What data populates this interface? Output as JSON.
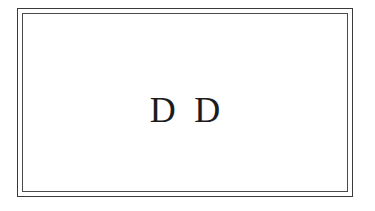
{
  "canvas": {
    "width": 375,
    "height": 211,
    "background_color": "#ffffff"
  },
  "frame": {
    "style": "double-rule",
    "outer_line_color": "#3a3a3c",
    "inner_line_color": "#4a4a4e",
    "interior_color": "#ffffff"
  },
  "content": {
    "monogram": "D D",
    "monogram_color": "#1c1c1e",
    "typeface_style": "serif",
    "letters": [
      "D",
      "D"
    ]
  }
}
